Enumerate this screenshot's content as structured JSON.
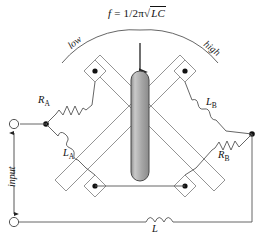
{
  "diagram": {
    "title_formula": {
      "lhs": "f",
      "equals": "=",
      "numerator": "1",
      "slash": "/",
      "denominator_num": "2",
      "denominator_pi": "π",
      "radical": "√",
      "radicand": "LC",
      "full_text": "f = 1/2π√LC"
    },
    "arc_labels": {
      "left": "low",
      "right": "high"
    },
    "components": {
      "r_a": {
        "label": "R",
        "sub": "A",
        "type": "resistor"
      },
      "l_a": {
        "label": "L",
        "sub": "A",
        "type": "inductor"
      },
      "r_b": {
        "label": "R",
        "sub": "B",
        "type": "resistor"
      },
      "l_b": {
        "label": "L",
        "sub": "B",
        "type": "inductor"
      },
      "l_main": {
        "label": "L",
        "sub": "",
        "type": "inductor"
      }
    },
    "terminals": {
      "input_label": "input",
      "top_terminal": "input-terminal-top",
      "bottom_terminal": "input-terminal-bottom"
    },
    "colors": {
      "wire": "#3a3a3a",
      "shaft_fill": "#a8a8a8",
      "shaft_stroke": "#4a4a4a",
      "node_dot": "#111111",
      "text": "#111111"
    }
  }
}
